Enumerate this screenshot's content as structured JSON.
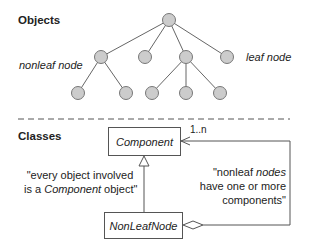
{
  "objects_section": {
    "title": "Objects",
    "nonleaf_label": "nonleaf node",
    "leaf_label": "leaf node",
    "tree": {
      "node_color": "#cccccc",
      "nodes": [
        {
          "id": "root",
          "x": 169,
          "y": 20
        },
        {
          "id": "a",
          "x": 101,
          "y": 57
        },
        {
          "id": "b",
          "x": 145,
          "y": 57
        },
        {
          "id": "c",
          "x": 186,
          "y": 57
        },
        {
          "id": "d",
          "x": 227,
          "y": 57
        },
        {
          "id": "a1",
          "x": 78,
          "y": 93
        },
        {
          "id": "a2",
          "x": 126,
          "y": 93
        },
        {
          "id": "c1",
          "x": 152,
          "y": 93
        },
        {
          "id": "c2",
          "x": 186,
          "y": 93
        },
        {
          "id": "c3",
          "x": 220,
          "y": 93
        }
      ],
      "edges": [
        [
          "root",
          "a"
        ],
        [
          "root",
          "b"
        ],
        [
          "root",
          "c"
        ],
        [
          "root",
          "d"
        ],
        [
          "a",
          "a1"
        ],
        [
          "a",
          "a2"
        ],
        [
          "c",
          "c1"
        ],
        [
          "c",
          "c2"
        ],
        [
          "c",
          "c3"
        ]
      ]
    }
  },
  "classes_section": {
    "title": "Classes",
    "component_class": "Component",
    "nonleaf_class": "NonLeafNode",
    "multiplicity": "1..n",
    "note_left_pre": "\"every object involved",
    "note_left_line2_pre": "is a ",
    "note_left_line2_it": "Component",
    "note_left_line2_post": " object\"",
    "note_right_line1_pre": "\"nonleaf ",
    "note_right_line1_it": "nodes",
    "note_right_line2": "have one or more",
    "note_right_line3": "components\""
  }
}
